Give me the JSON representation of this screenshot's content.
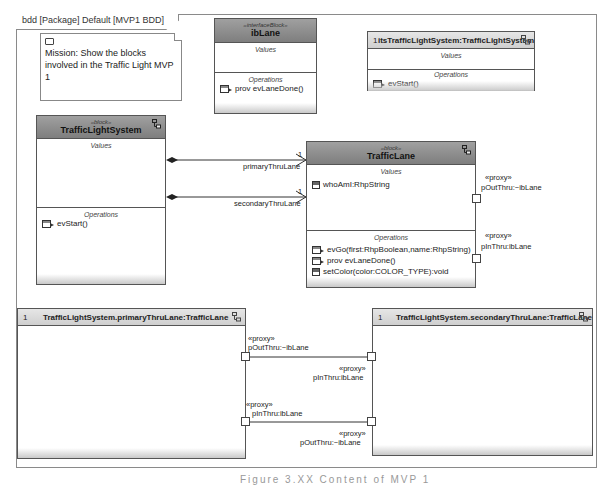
{
  "frame": {
    "tab_label": "bdd [Package] Default [MVP1 BDD]"
  },
  "note": {
    "text": "Mission: Show the blocks involved in the Traffic Light MVP 1"
  },
  "blocks": {
    "ibLane": {
      "stereotype": "«interfaceBlock»",
      "name": "ibLane",
      "values_title": "Values",
      "operations_title": "Operations",
      "operations": [
        "prov evLaneDone()"
      ]
    },
    "itsTrafficLightSystem": {
      "multiplicity": "1",
      "name": "itsTrafficLightSystem:TrafficLightSystem",
      "values_title": "Values",
      "operations_title": "Operations",
      "operations": [
        "evStart()"
      ]
    },
    "trafficLightSystem": {
      "stereotype": "«block»",
      "name": "TrafficLightSystem",
      "values_title": "Values",
      "operations_title": "Operations",
      "operations": [
        "evStart()"
      ]
    },
    "trafficLane": {
      "stereotype": "«block»",
      "name": "TrafficLane",
      "values_title": "Values",
      "values": [
        "whoAmI:RhpString"
      ],
      "operations_title": "Operations",
      "operations": [
        "evGo(first:RhpBoolean,name:RhpString)",
        "prov evLaneDone()",
        "setColor(color:COLOR_TYPE):void"
      ]
    }
  },
  "associations": [
    {
      "role": "primaryThruLane",
      "multiplicity": "1"
    },
    {
      "role": "secondaryThruLane",
      "multiplicity": "1"
    }
  ],
  "ports": {
    "trafficLane_out": {
      "stereotype": "«proxy»",
      "name": "pOutThru:~ibLane"
    },
    "trafficLane_in": {
      "stereotype": "«proxy»",
      "name": "pInThru:ibLane"
    }
  },
  "parts": {
    "primary": {
      "multiplicity": "1",
      "name": "TrafficLightSystem.primaryThruLane:TrafficLane"
    },
    "secondary": {
      "multiplicity": "1",
      "name": "TrafficLightSystem.secondaryThruLane:TrafficLane"
    }
  },
  "part_ports": {
    "primary_out": {
      "stereotype": "«proxy»",
      "name": "pOutThru:~ibLane"
    },
    "secondary_in": {
      "stereotype": "«proxy»",
      "name": "pInThru:ibLane"
    },
    "primary_in": {
      "stereotype": "«proxy»",
      "name": "pInThru:ibLane"
    },
    "secondary_out": {
      "stereotype": "«proxy»",
      "name": "pOutThru:~ibLane"
    }
  },
  "caption": "Figure 3.XX Content of MVP 1"
}
